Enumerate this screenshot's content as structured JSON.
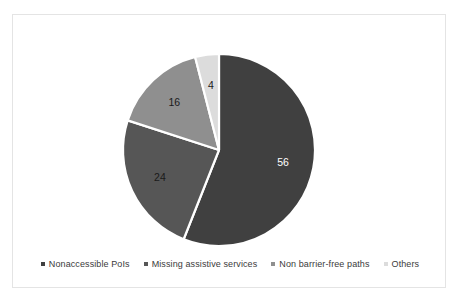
{
  "chart_data": {
    "type": "pie",
    "title": "",
    "categories": [
      "Nonaccessible PoIs",
      "Missing assistive services",
      "Non barrier-free paths",
      "Others"
    ],
    "values": [
      56,
      24,
      16,
      4
    ],
    "data_labels": [
      "56",
      "24",
      "16",
      "4"
    ],
    "colors": [
      "#404040",
      "#565656",
      "#8f8f8f",
      "#dcdcdc"
    ],
    "label_colors": [
      "#ffffff",
      "#1a1a1a",
      "#1a1a1a",
      "#1a1a1a"
    ],
    "slice_border_color": "#ffffff",
    "start_angle_deg": 0,
    "direction": "clockwise",
    "legend_position": "bottom",
    "grid": false,
    "total": 100
  },
  "legend": {
    "items": [
      {
        "label": "Nonaccessible PoIs",
        "color": "#404040"
      },
      {
        "label": "Missing assistive services",
        "color": "#565656"
      },
      {
        "label": "Non barrier-free paths",
        "color": "#8f8f8f"
      },
      {
        "label": "Others",
        "color": "#dcdcdc"
      }
    ]
  }
}
